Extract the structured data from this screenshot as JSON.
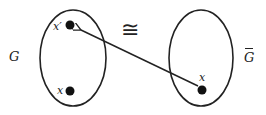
{
  "diagram": {
    "left_set": {
      "label": "G",
      "points": [
        {
          "label": "x′",
          "cx": 70,
          "cy": 25
        },
        {
          "label": "x",
          "cx": 70,
          "cy": 91
        }
      ]
    },
    "right_set": {
      "label": "G",
      "label_overline": true,
      "points": [
        {
          "label": "x",
          "cx": 202,
          "cy": 90
        }
      ]
    },
    "relation_symbol": "≅",
    "arrow": {
      "from": "right_set.x",
      "to": "left_set.x′"
    },
    "colors": {
      "stroke": "#222222",
      "background": "#ffffff"
    }
  }
}
